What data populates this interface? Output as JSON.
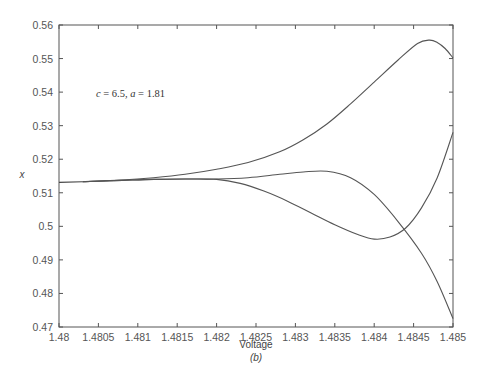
{
  "chart_data": {
    "type": "line",
    "title": "",
    "xlabel": "Voltage",
    "ylabel": "x",
    "sublabel": "(b)",
    "annotation": "c = 6.5, a = 1.81",
    "xlim": [
      1.48,
      1.485
    ],
    "ylim": [
      0.47,
      0.56
    ],
    "grid": false,
    "legend": null,
    "x_ticks": [
      "1.48",
      "1.4805",
      "1.481",
      "1.4815",
      "1.482",
      "1.4825",
      "1.483",
      "1.4835",
      "1.484",
      "1.4845",
      "1.485"
    ],
    "y_ticks": [
      "0.47",
      "0.48",
      "0.49",
      "0.5",
      "0.51",
      "0.52",
      "0.53",
      "0.54",
      "0.55",
      "0.56"
    ],
    "series": [
      {
        "name": "upper branch",
        "x": [
          1.4803,
          1.4808,
          1.4812,
          1.4816,
          1.482,
          1.4824,
          1.4828,
          1.4831,
          1.4834,
          1.4837,
          1.484,
          1.4843,
          1.48455,
          1.4847,
          1.4848,
          1.4849,
          1.485
        ],
        "y": [
          0.5133,
          0.5138,
          0.5145,
          0.5155,
          0.517,
          0.519,
          0.5222,
          0.5258,
          0.5305,
          0.5365,
          0.543,
          0.5495,
          0.5545,
          0.5555,
          0.5548,
          0.553,
          0.5502
        ]
      },
      {
        "name": "middle branch",
        "x": [
          1.4803,
          1.4808,
          1.4812,
          1.4816,
          1.482,
          1.4824,
          1.4828,
          1.4831,
          1.4834,
          1.4837,
          1.484,
          1.4843,
          1.4846,
          1.4848,
          1.485
        ],
        "y": [
          0.5133,
          0.5137,
          0.514,
          0.5141,
          0.5141,
          0.5145,
          0.5155,
          0.5162,
          0.5164,
          0.5145,
          0.5095,
          0.5015,
          0.492,
          0.4835,
          0.4725
        ]
      },
      {
        "name": "lower branch",
        "x": [
          1.4803,
          1.4808,
          1.4812,
          1.4816,
          1.482,
          1.4823,
          1.4826,
          1.4829,
          1.4832,
          1.4835,
          1.4838,
          1.484,
          1.4842,
          1.4844,
          1.4846,
          1.4848,
          1.485
        ],
        "y": [
          0.5133,
          0.5137,
          0.514,
          0.5141,
          0.514,
          0.5128,
          0.5105,
          0.5075,
          0.504,
          0.5005,
          0.4975,
          0.4962,
          0.4968,
          0.4995,
          0.5055,
          0.5145,
          0.528
        ]
      }
    ]
  }
}
